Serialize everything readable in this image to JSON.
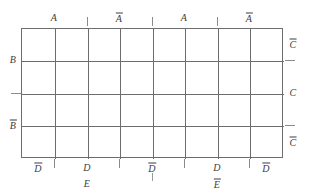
{
  "diagram": {
    "variables": [
      "A",
      "B",
      "C",
      "D",
      "E"
    ],
    "colors": {
      "background": "#ffffff",
      "grid_line": "#6d6d6d",
      "tick": "#8a8a8a",
      "text": "#3d3d3d"
    },
    "grid": {
      "columns": 8,
      "rows": 4,
      "left": 21,
      "top": 28,
      "width": 262,
      "height": 130
    },
    "top_labels": [
      {
        "text": "A",
        "overline": false,
        "x": 54
      },
      {
        "text": "A",
        "overline": true,
        "x": 119
      },
      {
        "text": "A",
        "overline": false,
        "x": 184
      },
      {
        "text": "A",
        "overline": true,
        "x": 249
      }
    ],
    "bottom_labels": [
      {
        "text": "D",
        "overline": true,
        "x": 38
      },
      {
        "text": "D",
        "overline": false,
        "x": 87
      },
      {
        "text": "D",
        "overline": true,
        "x": 152
      },
      {
        "text": "D",
        "overline": false,
        "x": 217
      },
      {
        "text": "D",
        "overline": true,
        "x": 266
      }
    ],
    "outer_bottom_labels": [
      {
        "text": "E",
        "overline": false,
        "x": 87
      },
      {
        "text": "E",
        "overline": true,
        "x": 217
      }
    ],
    "left_labels": [
      {
        "text": "B",
        "overline": false,
        "y": 60
      },
      {
        "text": "B",
        "overline": true,
        "y": 125
      }
    ],
    "right_labels": [
      {
        "text": "C",
        "overline": true,
        "y": 44
      },
      {
        "text": "C",
        "overline": false,
        "y": 93
      },
      {
        "text": "C",
        "overline": true,
        "y": 142
      }
    ],
    "vertical_lines_x": [
      54,
      87,
      119,
      152,
      184,
      217,
      249
    ],
    "horizontal_lines_y": [
      60,
      93,
      125
    ],
    "top_ticks_x": [
      87,
      152,
      217
    ],
    "bottom_ticks_x": [
      54,
      119,
      184,
      249
    ],
    "mid_bottom_tick_x": 152,
    "left_ticks_y": [
      93
    ],
    "right_ticks_y": [
      60,
      125
    ]
  }
}
